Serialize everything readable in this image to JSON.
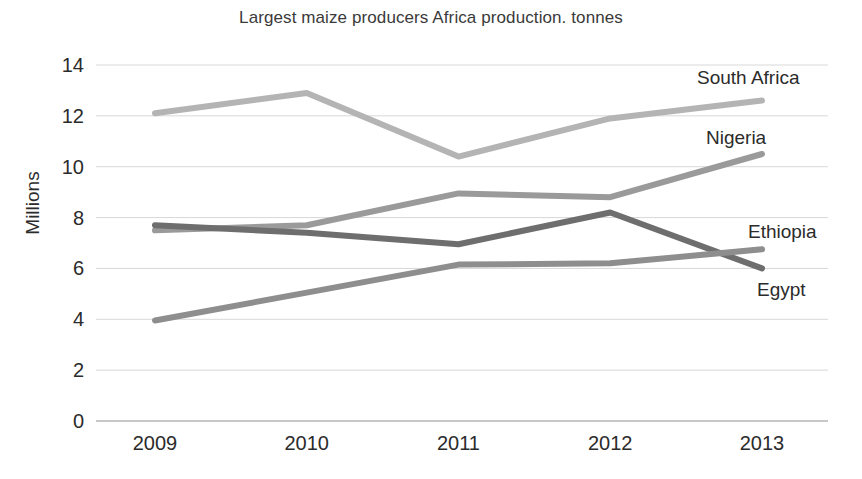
{
  "chart_data": {
    "type": "line",
    "title": "Largest maize producers Africa production. tonnes",
    "xlabel": "",
    "ylabel": "Millions",
    "x": [
      "2009",
      "2010",
      "2011",
      "2012",
      "2013"
    ],
    "categories": [
      "2009",
      "2010",
      "2011",
      "2012",
      "2013"
    ],
    "ylim": [
      0,
      14
    ],
    "yticks": [
      "0",
      "2",
      "4",
      "6",
      "8",
      "10",
      "12",
      "14"
    ],
    "grid": true,
    "legend_position": "right-inline-labels",
    "series": [
      {
        "name": "South Africa",
        "color": "#b4b4b4",
        "values": [
          12.1,
          12.9,
          10.4,
          11.9,
          12.6
        ]
      },
      {
        "name": "Nigeria",
        "color": "#9a9a9a",
        "values": [
          7.5,
          7.7,
          8.95,
          8.8,
          10.5
        ]
      },
      {
        "name": "Ethiopia",
        "color": "#6e6e6e",
        "values": [
          7.7,
          7.4,
          6.95,
          8.2,
          6.0
        ]
      },
      {
        "name": "Egypt",
        "color": "#8e8e8e",
        "values": [
          3.95,
          5.05,
          6.15,
          6.2,
          6.75
        ]
      }
    ]
  },
  "axis": {
    "y_label": "Millions",
    "y_ticks": [
      "14",
      "12",
      "10",
      "8",
      "6",
      "4",
      "2",
      "0"
    ],
    "x_ticks": [
      "2009",
      "2010",
      "2011",
      "2012",
      "2013"
    ]
  },
  "labels": {
    "south_africa": "South Africa",
    "nigeria": "Nigeria",
    "ethiopia": "Ethiopia",
    "egypt": "Egypt"
  },
  "colors": {
    "south_africa": "#b4b4b4",
    "nigeria": "#9a9a9a",
    "ethiopia": "#6e6e6e",
    "egypt": "#8e8e8e",
    "grid": "#d8d8d8",
    "text": "#2b2b2b"
  }
}
